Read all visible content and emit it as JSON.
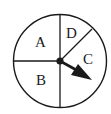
{
  "spinner": {
    "sections": [
      {
        "label": "A",
        "position": "upper-left"
      },
      {
        "label": "B",
        "position": "lower-left"
      },
      {
        "label": "C",
        "position": "right"
      },
      {
        "label": "D",
        "position": "upper-right-narrow"
      }
    ],
    "pointer": {
      "points_to": "C"
    },
    "colors": {
      "stroke": "#1a1a1a",
      "background": "#ffffff"
    }
  }
}
